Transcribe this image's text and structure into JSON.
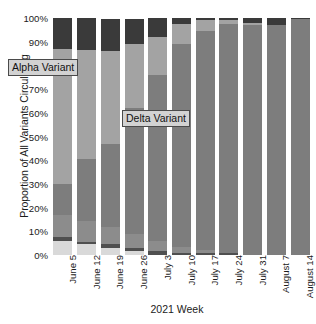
{
  "chart_data": {
    "type": "bar",
    "stacked": true,
    "normalized": "100%",
    "title": "",
    "subtitle": "",
    "xlabel": "2021 Week",
    "ylabel": "Proportion of All Variants Circulating",
    "categories": [
      "June 5",
      "June 12",
      "June 19",
      "June 26",
      "July 3",
      "July 10",
      "July 17",
      "July 24",
      "July 31",
      "August 7",
      "August 14"
    ],
    "ytick_labels": [
      "0%",
      "10%",
      "20%",
      "30%",
      "40%",
      "50%",
      "60%",
      "70%",
      "80%",
      "90%",
      "100%"
    ],
    "ytick_values": [
      0,
      10,
      20,
      30,
      40,
      50,
      60,
      70,
      80,
      90,
      100
    ],
    "ylim": [
      0,
      100
    ],
    "grid": false,
    "legend": "none",
    "annotations": [
      {
        "text": "Alpha Variant",
        "at_category": "June 5",
        "at_value": 72
      },
      {
        "text": "Delta Variant",
        "at_category": "July 10",
        "at_value": 50
      }
    ],
    "series": [
      {
        "name": "Other Bottom",
        "color": "#d9d9d9",
        "values": [
          6.0,
          4.5,
          3.0,
          1.5,
          0.0,
          0.0,
          0.0,
          0.0,
          0.0,
          0.0,
          0.0
        ]
      },
      {
        "name": "Gamma",
        "color": "#4f4f4f",
        "values": [
          1.5,
          1.0,
          1.5,
          1.5,
          1.5,
          1.0,
          1.0,
          0.8,
          0.0,
          0.0,
          0.0
        ]
      },
      {
        "name": "Delta",
        "color": "#8c8c8c",
        "values": [
          9.5,
          9.0,
          7.5,
          6.0,
          4.5,
          2.5,
          1.0,
          0.0,
          0.0,
          0.0,
          0.0
        ]
      },
      {
        "name": "Alpha",
        "color": "#7d7d7d",
        "values": [
          13.0,
          26.0,
          35.0,
          53.0,
          70.0,
          85.5,
          92.5,
          96.5,
          97.0,
          97.0,
          99.5
        ]
      },
      {
        "name": "Beta",
        "color": "#a3a3a3",
        "values": [
          57.0,
          46.0,
          39.0,
          27.0,
          16.0,
          8.5,
          4.5,
          2.0,
          1.0,
          0.0,
          0.0
        ]
      },
      {
        "name": "Other Top",
        "color": "#3a3a3a",
        "values": [
          13.0,
          13.5,
          13.5,
          10.5,
          8.0,
          2.5,
          1.0,
          0.7,
          2.0,
          3.0,
          0.5
        ]
      }
    ]
  }
}
